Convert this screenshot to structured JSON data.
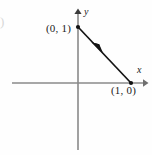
{
  "figure": {
    "title": "",
    "background_color": "#fefefe",
    "width": 152,
    "height": 155
  },
  "axes": {
    "color": "#8a8a8a",
    "x_axis": {
      "label": "x",
      "label_style": "italic",
      "start_px": [
        12,
        83
      ],
      "end_px": [
        146,
        83
      ],
      "arrow": "right"
    },
    "y_axis": {
      "label": "y",
      "label_style": "italic",
      "start_px": [
        78,
        150
      ],
      "end_px": [
        78,
        10
      ],
      "arrow": "up"
    },
    "origin_px": [
      78,
      83
    ]
  },
  "segment": {
    "color": "#111111",
    "from_label": "(1, 0)",
    "to_label": "(0, 1)",
    "from_px": [
      131,
      83
    ],
    "to_px": [
      78,
      27
    ],
    "direction": "from (1, 0) to (0, 1)",
    "arrowhead_at_px": [
      97,
      48
    ],
    "arrowhead_points_toward": "(0, 1)"
  },
  "points": [
    {
      "name": "point-0-1",
      "label": "(0, 1)",
      "coords": [
        0,
        1
      ],
      "marker_px": [
        78,
        27
      ],
      "label_px": [
        46,
        23
      ]
    },
    {
      "name": "point-1-0",
      "label": "(1, 0)",
      "coords": [
        1,
        0
      ],
      "marker_px": [
        131,
        83
      ],
      "label_px": [
        111,
        85
      ]
    }
  ],
  "edge_artifact": {
    "text": ")",
    "note": "faint cut-off glyph at left edge"
  }
}
